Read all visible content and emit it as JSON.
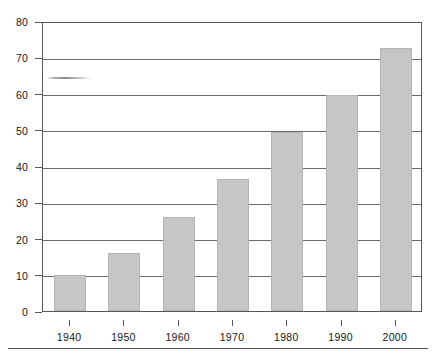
{
  "chart_data": {
    "type": "bar",
    "title": "",
    "subtitle": "",
    "xlabel": "",
    "ylabel": "",
    "categories": [
      "1940",
      "1950",
      "1960",
      "1970",
      "1980",
      "1990",
      "2000"
    ],
    "values": [
      10,
      16,
      26,
      36.5,
      49.5,
      59.5,
      72.5
    ],
    "ylim": [
      0,
      80
    ],
    "y_ticks": [
      "0",
      "10",
      "20",
      "30",
      "40",
      "50",
      "60",
      "70",
      "80"
    ],
    "y_tick_values": [
      0,
      10,
      20,
      30,
      40,
      50,
      60,
      70,
      80
    ],
    "grid": "horizontal",
    "legend": "none",
    "series": [
      {
        "name": "",
        "values": [
          10,
          16,
          26,
          36.5,
          49.5,
          59.5,
          72.5
        ]
      }
    ],
    "colors": {
      "bar_fill": "#c6c6c6",
      "bar_stroke": "#b4b4b4",
      "axis": "#585858",
      "gridline": "#6b6b6b",
      "text": "#161616",
      "background": "#ffffff",
      "rule": "#4f4f4f"
    }
  },
  "artifacts": {
    "scan_smudge_label": "scan-artifact-smudge",
    "bottom_rule_label": "horizontal-rule"
  }
}
